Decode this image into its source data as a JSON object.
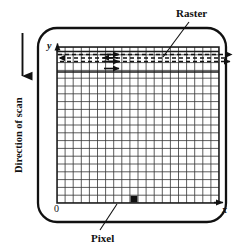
{
  "figure": {
    "kind": "raster-scan-display-diagram",
    "background_color": "#ffffff",
    "ink_color": "#111111",
    "screen": {
      "name": "crt-screen-frame",
      "shape": "rounded-rectangle",
      "x": 38,
      "y": 28,
      "width": 188,
      "height": 194,
      "corner_radius": 18,
      "stroke_width": 2.2
    },
    "grid": {
      "name": "pixel-grid",
      "x": 57,
      "y": 47,
      "width": 162,
      "height": 156,
      "columns": 20,
      "rows": 20,
      "line_color": "#2b2b2b",
      "line_width": 0.8,
      "border_width": 1.6
    },
    "axes": {
      "y_label": "y",
      "x_label": "x",
      "origin_label": "0",
      "y_arrow": "up",
      "x_arrow": "right"
    },
    "pixel_marker": {
      "name": "highlighted-pixel",
      "fill": "#111111",
      "column_index": 9,
      "row_index": 19,
      "x": 114,
      "y": 195,
      "width": 9,
      "height": 9
    },
    "raster_lines": {
      "count": 3,
      "style": "dashed",
      "dash_pattern": "4 3",
      "stroke_width": 1.6,
      "rows": [
        {
          "y": 54,
          "direction": "right",
          "has_return_sweep": true
        },
        {
          "y": 61,
          "direction": "right",
          "has_return_sweep": true
        },
        {
          "y": 68,
          "direction": "right",
          "has_return_sweep": false
        }
      ]
    },
    "scan_arrow": {
      "name": "direction-of-scan-arrow",
      "direction": "down",
      "x": 22,
      "y_start": 34,
      "y_end": 78
    }
  },
  "labels": {
    "raster": "Raster",
    "pixel": "Pixel",
    "direction_of_scan": "Direction of scan",
    "y_axis": "y",
    "x_axis": "x",
    "origin": "0"
  },
  "leader_lines": [
    {
      "name": "raster-leader-line",
      "from_label": "Raster",
      "x1": 188,
      "y1": 22,
      "x2": 163,
      "y2": 57
    },
    {
      "name": "pixel-leader-line",
      "from_label": "Pixel",
      "x1": 101,
      "y1": 229,
      "x2": 117,
      "y2": 203
    }
  ]
}
